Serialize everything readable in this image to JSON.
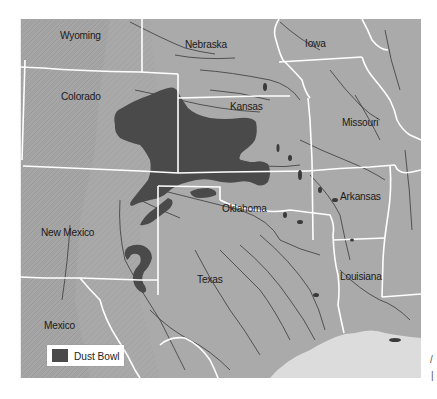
{
  "map": {
    "type": "thematic-region-map",
    "colors": {
      "land": "#a9a9a9",
      "land_relief": "#9a9a9a",
      "water": "#dcdcdc",
      "dust_bowl": "#4a4a4a",
      "borders": "#ffffff",
      "rivers": "#3a3a3a"
    },
    "labels": {
      "wyoming": "Wyoming",
      "nebraska": "Nebraska",
      "iowa": "Iowa",
      "colorado": "Colorado",
      "kansas": "Kansas",
      "missouri": "Missouri",
      "oklahoma": "Oklahoma",
      "arkansas": "Arkansas",
      "new_mexico": "New Mexico",
      "texas": "Texas",
      "louisiana": "Louisiana",
      "mexico": "Mexico"
    },
    "legend": {
      "items": [
        {
          "label": "Dust Bowl",
          "color": "#4a4a4a"
        }
      ]
    }
  }
}
